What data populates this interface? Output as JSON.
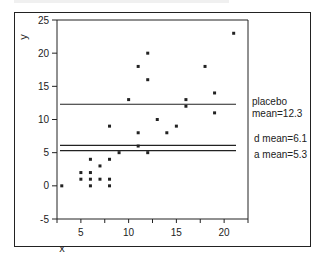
{
  "chart_data": {
    "type": "scatter",
    "title": "",
    "xlabel": "x",
    "ylabel": "y",
    "xlim": [
      2.5,
      22.5
    ],
    "ylim": [
      -5,
      25
    ],
    "x_ticks": [
      5,
      10,
      15,
      20
    ],
    "y_ticks": [
      -5,
      0,
      5,
      10,
      15,
      20,
      25
    ],
    "grid": false,
    "points": [
      {
        "x": 3,
        "y": 0
      },
      {
        "x": 5,
        "y": 2
      },
      {
        "x": 5,
        "y": 1
      },
      {
        "x": 6,
        "y": 4
      },
      {
        "x": 6,
        "y": 2
      },
      {
        "x": 6,
        "y": 1
      },
      {
        "x": 6,
        "y": 0
      },
      {
        "x": 7,
        "y": 3
      },
      {
        "x": 7,
        "y": 1
      },
      {
        "x": 8,
        "y": 9
      },
      {
        "x": 8,
        "y": 4
      },
      {
        "x": 8,
        "y": 1
      },
      {
        "x": 8,
        "y": 0
      },
      {
        "x": 9,
        "y": 5
      },
      {
        "x": 10,
        "y": 13
      },
      {
        "x": 11,
        "y": 18
      },
      {
        "x": 11,
        "y": 8
      },
      {
        "x": 11,
        "y": 6
      },
      {
        "x": 12,
        "y": 20
      },
      {
        "x": 12,
        "y": 16
      },
      {
        "x": 12,
        "y": 5
      },
      {
        "x": 13,
        "y": 10
      },
      {
        "x": 14,
        "y": 8
      },
      {
        "x": 15,
        "y": 9
      },
      {
        "x": 16,
        "y": 13
      },
      {
        "x": 16,
        "y": 12
      },
      {
        "x": 18,
        "y": 18
      },
      {
        "x": 19,
        "y": 14
      },
      {
        "x": 19,
        "y": 11
      },
      {
        "x": 21,
        "y": 23
      }
    ],
    "reference_lines": [
      {
        "name": "placebo",
        "y": 12.3,
        "label": "placebo\nmean=12.3"
      },
      {
        "name": "d",
        "y": 6.1,
        "label": "d mean=6.1"
      },
      {
        "name": "a",
        "y": 5.3,
        "label": "a mean=5.3"
      }
    ]
  },
  "labels": {
    "x_axis": "x",
    "y_axis": "y",
    "placebo": "placebo\nmean=12.3",
    "d_mean": "d mean=6.1",
    "a_mean": "a mean=5.3"
  }
}
